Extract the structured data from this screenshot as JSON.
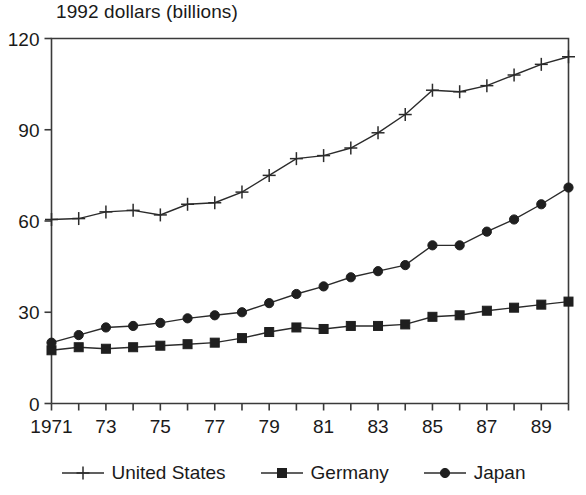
{
  "chart_data": {
    "type": "line",
    "title": "1992 dollars (billions)",
    "xlabel": "",
    "ylabel": "",
    "ylim": [
      0,
      120
    ],
    "xlim": [
      1971,
      1990
    ],
    "yticks": [
      0,
      30,
      60,
      90,
      120
    ],
    "ytick_labels": [
      "0",
      "30",
      "60",
      "90",
      "120"
    ],
    "x": [
      1971,
      1972,
      1973,
      1974,
      1975,
      1976,
      1977,
      1978,
      1979,
      1980,
      1981,
      1982,
      1983,
      1984,
      1985,
      1986,
      1987,
      1988,
      1989,
      1990
    ],
    "xtick_labels": [
      "1971",
      "",
      "73",
      "",
      "75",
      "",
      "77",
      "",
      "79",
      "",
      "81",
      "",
      "83",
      "",
      "85",
      "",
      "87",
      "",
      "89",
      ""
    ],
    "grid": false,
    "legend_position": "below",
    "series": [
      {
        "name": "United States",
        "marker": "plus",
        "color": "#2b2b2b",
        "values": [
          60.5,
          60.8,
          63.0,
          63.5,
          62.0,
          65.5,
          66.0,
          69.5,
          75.0,
          80.5,
          81.5,
          84.0,
          89.0,
          95.0,
          103.0,
          102.5,
          104.5,
          108.0,
          111.5,
          114.0
        ]
      },
      {
        "name": "Germany",
        "marker": "square",
        "color": "#1f1f1f",
        "values": [
          17.5,
          18.5,
          18.0,
          18.5,
          19.0,
          19.5,
          20.0,
          21.5,
          23.5,
          25.0,
          24.5,
          25.5,
          25.5,
          26.0,
          28.5,
          29.0,
          30.5,
          31.5,
          32.5,
          33.5
        ]
      },
      {
        "name": "Japan",
        "marker": "circle",
        "color": "#1f1f1f",
        "values": [
          20.0,
          22.5,
          25.0,
          25.5,
          26.5,
          28.0,
          29.0,
          30.0,
          33.0,
          36.0,
          38.5,
          41.5,
          43.5,
          45.5,
          52.0,
          52.0,
          56.5,
          60.5,
          65.5,
          71.0
        ]
      }
    ]
  },
  "legend": {
    "entries": [
      {
        "label": "United States",
        "marker": "plus-marker"
      },
      {
        "label": "Germany",
        "marker": "square-marker"
      },
      {
        "label": "Japan",
        "marker": "circle-marker"
      }
    ]
  }
}
